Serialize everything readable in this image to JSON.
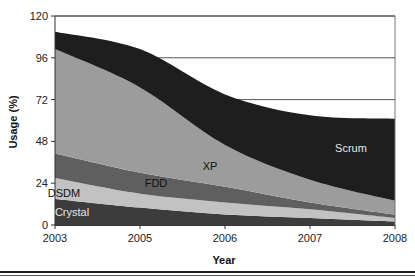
{
  "chart_data": {
    "type": "area",
    "stacked": true,
    "title": "",
    "xlabel": "Year",
    "ylabel": "Usage (%)",
    "categories": [
      "2003",
      "2005",
      "2006",
      "2007",
      "2008"
    ],
    "ylim": [
      0,
      120
    ],
    "yticks": [
      0,
      24,
      48,
      72,
      96,
      120
    ],
    "grid": {
      "horizontal": true,
      "values": [
        72,
        96,
        120
      ]
    },
    "legend": "inline labels",
    "series": [
      {
        "name": "Crystal",
        "values": [
          15,
          10,
          6,
          4,
          2
        ],
        "color": "#3c3c3c",
        "label_color": "#e6e6e6"
      },
      {
        "name": "DSDM",
        "values": [
          12,
          8,
          7,
          5,
          2
        ],
        "color": "#c2c2c2",
        "label_color": "#111111"
      },
      {
        "name": "FDD",
        "values": [
          14,
          12,
          9,
          4,
          2
        ],
        "color": "#5f5f5f",
        "label_color": "#111111"
      },
      {
        "name": "XP",
        "values": [
          60,
          49,
          24,
          13,
          8
        ],
        "color": "#9c9c9c",
        "label_color": "#111111"
      },
      {
        "name": "Scrum",
        "values": [
          10,
          22,
          29,
          37,
          47
        ],
        "color": "#1e1e1e",
        "label_color": "#e6e6e6"
      }
    ],
    "annotations": [
      {
        "text": "Crystal",
        "x": 72,
        "y": 216
      },
      {
        "text": "DSDM",
        "x": 64,
        "y": 197
      },
      {
        "text": "FDD",
        "x": 156,
        "y": 187
      },
      {
        "text": "XP",
        "x": 210,
        "y": 170
      },
      {
        "text": "Scrum",
        "x": 351,
        "y": 152
      }
    ]
  }
}
